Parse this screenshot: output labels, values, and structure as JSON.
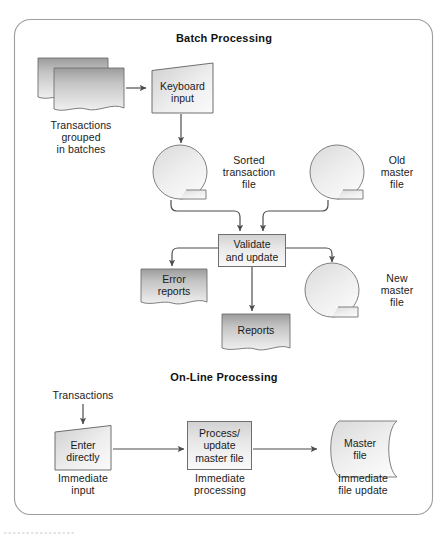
{
  "figure": {
    "kind": "flowchart",
    "background": "#ffffff",
    "panel_border_color": "#9a9a9a",
    "shape_stroke": "#6e6e6e",
    "connector_color": "#4d4d4d",
    "text_color": "#1b1b1b",
    "fill_light_top": "#d6d6d6",
    "fill_light_bottom": "#f7f7f7",
    "fill_doc_top": "#9e9e9e",
    "fill_doc_bottom": "#efefef"
  },
  "sections": {
    "batch": {
      "title": "Batch Processing"
    },
    "online": {
      "title": "On-Line Processing"
    }
  },
  "nodes": {
    "transactions_stack": {
      "shape": "stacked-document",
      "caption_lines": [
        "Transactions",
        "grouped",
        "in batches"
      ],
      "caption": "Transactions\ngrouped\nin batches"
    },
    "keyboard_input": {
      "shape": "manual-input-trapezoid",
      "label_lines": [
        "Keyboard",
        "input"
      ],
      "label": "Keyboard\ninput"
    },
    "sorted_transaction_file": {
      "shape": "magnetic-tape",
      "caption_lines": [
        "Sorted",
        "transaction",
        "file"
      ],
      "caption": "Sorted\ntransaction\nfile"
    },
    "old_master_file": {
      "shape": "magnetic-tape",
      "caption_lines": [
        "Old",
        "master",
        "file"
      ],
      "caption": "Old\nmaster\nfile"
    },
    "validate_and_update": {
      "shape": "process-rectangle",
      "label_lines": [
        "Validate",
        "and update"
      ],
      "label": "Validate\nand update"
    },
    "error_reports": {
      "shape": "document",
      "label_lines": [
        "Error",
        "reports"
      ],
      "label": "Error\nreports"
    },
    "reports": {
      "shape": "document",
      "label_lines": [
        "Reports"
      ],
      "label": "Reports"
    },
    "new_master_file": {
      "shape": "magnetic-tape",
      "caption_lines": [
        "New",
        "master",
        "file"
      ],
      "caption": "New\nmaster\nfile"
    },
    "online_transactions": {
      "shape": "text-label",
      "label": "Transactions"
    },
    "enter_directly": {
      "shape": "manual-input-trapezoid",
      "label_lines": [
        "Enter",
        "directly"
      ],
      "label": "Enter\ndirectly",
      "caption_lines": [
        "Immediate",
        "input"
      ],
      "caption": "Immediate\ninput"
    },
    "process_update_master_file": {
      "shape": "process-rectangle",
      "label_lines": [
        "Process/",
        "update",
        "master file"
      ],
      "label": "Process/\nupdate\nmaster file",
      "caption_lines": [
        "Immediate",
        "processing"
      ],
      "caption": "Immediate\nprocessing"
    },
    "master_file": {
      "shape": "direct-access-cylinder",
      "label_lines": [
        "Master",
        "file"
      ],
      "label": "Master\nfile",
      "caption_lines": [
        "Immediate",
        "file update"
      ],
      "caption": "Immediate\nfile update"
    }
  },
  "edges": [
    {
      "from": "transactions_stack",
      "to": "keyboard_input"
    },
    {
      "from": "keyboard_input",
      "to": "sorted_transaction_file"
    },
    {
      "from": "sorted_transaction_file",
      "to": "validate_and_update"
    },
    {
      "from": "old_master_file",
      "to": "validate_and_update"
    },
    {
      "from": "validate_and_update",
      "to": "error_reports"
    },
    {
      "from": "validate_and_update",
      "to": "reports"
    },
    {
      "from": "validate_and_update",
      "to": "new_master_file"
    },
    {
      "from": "online_transactions",
      "to": "enter_directly"
    },
    {
      "from": "enter_directly",
      "to": "process_update_master_file"
    },
    {
      "from": "process_update_master_file",
      "to": "master_file"
    }
  ]
}
